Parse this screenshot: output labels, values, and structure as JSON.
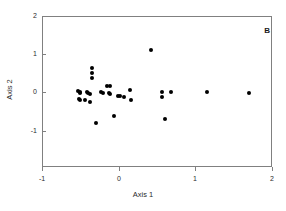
{
  "figure": {
    "panel_label": "B",
    "background_color": "#ffffff",
    "frame_color": "#808080",
    "point_color": "#000000"
  },
  "chart_data": {
    "type": "scatter",
    "title": "",
    "panel_label": "B",
    "xlabel": "Axis 1",
    "ylabel": "Axis 2",
    "xlim": [
      -1,
      2
    ],
    "ylim": [
      -1.95,
      2
    ],
    "xticks": [
      -1,
      0,
      1,
      2
    ],
    "xticklabels": [
      "-1",
      "0",
      "1",
      "2"
    ],
    "yticks": [
      -1,
      0,
      1,
      2
    ],
    "yticklabels": [
      "-1",
      "0",
      "1",
      "2"
    ],
    "grid": false,
    "legend": null,
    "marker": "filled-circle",
    "marker_color": "#000000",
    "series": [
      {
        "name": "samples",
        "points": [
          [
            -0.35,
            0.63
          ],
          [
            -0.35,
            0.5
          ],
          [
            -0.35,
            0.38
          ],
          [
            -0.53,
            0.04
          ],
          [
            -0.51,
            0.01
          ],
          [
            -0.5,
            -0.02
          ],
          [
            -0.42,
            0.02
          ],
          [
            -0.4,
            -0.01
          ],
          [
            -0.38,
            -0.03
          ],
          [
            -0.52,
            -0.16
          ],
          [
            -0.51,
            -0.19
          ],
          [
            -0.44,
            -0.2
          ],
          [
            -0.37,
            -0.25
          ],
          [
            -0.3,
            -0.8
          ],
          [
            -0.23,
            0.01
          ],
          [
            -0.2,
            -0.02
          ],
          [
            -0.15,
            0.17
          ],
          [
            -0.12,
            0.18
          ],
          [
            -0.13,
            -0.02
          ],
          [
            -0.11,
            -0.05
          ],
          [
            -0.06,
            -0.62
          ],
          [
            -0.01,
            -0.08
          ],
          [
            0.02,
            -0.1
          ],
          [
            0.07,
            -0.13
          ],
          [
            0.15,
            0.06
          ],
          [
            0.16,
            -0.19
          ],
          [
            0.42,
            1.1
          ],
          [
            0.56,
            0.02
          ],
          [
            0.57,
            -0.11
          ],
          [
            0.6,
            -0.7
          ],
          [
            0.68,
            0.02
          ],
          [
            1.15,
            0.02
          ],
          [
            1.7,
            0.0
          ]
        ]
      }
    ]
  }
}
